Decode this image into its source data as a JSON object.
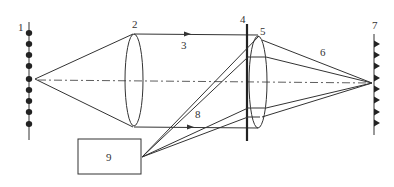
{
  "diagram": {
    "type": "optical-schematic",
    "colors": {
      "line": "#333333",
      "background": "#ffffff"
    },
    "labels": [
      {
        "id": "1",
        "text": "1",
        "x": 18,
        "y": 31
      },
      {
        "id": "2",
        "text": "2",
        "x": 132,
        "y": 28
      },
      {
        "id": "3",
        "text": "3",
        "x": 181,
        "y": 49
      },
      {
        "id": "4",
        "text": "4",
        "x": 240,
        "y": 23
      },
      {
        "id": "5",
        "text": "5",
        "x": 260,
        "y": 35
      },
      {
        "id": "6",
        "text": "6",
        "x": 320,
        "y": 56
      },
      {
        "id": "7",
        "text": "7",
        "x": 372,
        "y": 29
      },
      {
        "id": "8",
        "text": "8",
        "x": 195,
        "y": 118
      },
      {
        "id": "9",
        "text": "9",
        "x": 106,
        "y": 161
      }
    ],
    "components": {
      "source_array": {
        "label": "1",
        "x": 29,
        "y_top": 22,
        "y_bottom": 140,
        "dots_y": [
          33,
          44,
          55,
          66,
          79,
          90,
          101,
          112,
          124
        ]
      },
      "lens_2": {
        "label": "2",
        "cx": 134,
        "cy": 80,
        "rx": 9,
        "ry": 46
      },
      "collimated_beam": {
        "label": "3"
      },
      "plate_4": {
        "label": "4",
        "x": 247,
        "y_top": 24,
        "y_bottom": 141
      },
      "lens_5": {
        "label": "5",
        "cx": 258,
        "cy": 82,
        "rx": 9,
        "ry": 46
      },
      "converging_beam": {
        "label": "6"
      },
      "detector_array": {
        "label": "7",
        "x": 374,
        "y_top": 34,
        "y_bottom": 135,
        "markers_y": [
          44,
          55,
          66,
          78,
          89,
          100,
          112,
          123
        ]
      },
      "auxiliary_beams": {
        "label": "8"
      },
      "box_9": {
        "label": "9",
        "x": 78,
        "y": 139,
        "width": 63,
        "height": 35
      }
    },
    "optical_axis_y": 82
  }
}
